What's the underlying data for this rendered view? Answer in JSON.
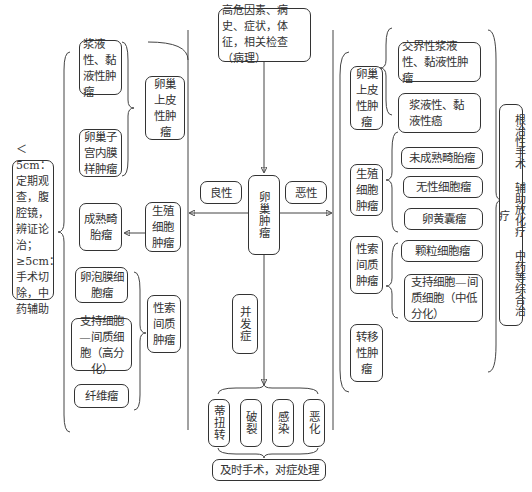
{
  "top": {
    "label": "高危因素、病史、症状，体征，相关检查（病理）"
  },
  "center": {
    "label": "卵巢肿瘤"
  },
  "benign_label": "良性",
  "malignant_label": "恶性",
  "complication_label": "并发症",
  "benign": {
    "treatment": "＜5cm：定期观查，腹腔镜，辨证论治；≥5cm：手术切除，中药辅助",
    "groups": [
      {
        "label": "卵巢上皮性肿瘤",
        "items": [
          "浆液性、黏液性肿瘤",
          "卵巢子宫内膜样肿瘤"
        ]
      },
      {
        "label": "生殖细胞肿瘤",
        "items": [
          "成熟畸胎瘤"
        ]
      },
      {
        "label": "性索间质肿瘤",
        "items": [
          "卵泡膜细胞瘤",
          "支持细胞—间质细胞（高分化）",
          "纤维瘤"
        ]
      }
    ]
  },
  "malignant": {
    "treatment": "根治性手术 辅助放化疗 中药等综合治疗",
    "groups": [
      {
        "label": "卵巢上皮性肿瘤",
        "items": [
          "交界性浆液性、黏液性肿瘤",
          "浆液性、黏液性癌"
        ]
      },
      {
        "label": "生殖细胞肿瘤",
        "items": [
          "未成熟畸胎瘤",
          "无性细胞瘤",
          "卵黄囊瘤"
        ]
      },
      {
        "label": "性索间质肿瘤",
        "items": [
          "颗粒细胞瘤",
          "支持细胞—间质细胞（中低分化）"
        ]
      },
      {
        "label": "转移性肿瘤",
        "items": []
      }
    ]
  },
  "complications": {
    "items": [
      "蒂扭转",
      "破裂",
      "感染",
      "恶化"
    ],
    "treatment": "及时手术，对症处理"
  }
}
